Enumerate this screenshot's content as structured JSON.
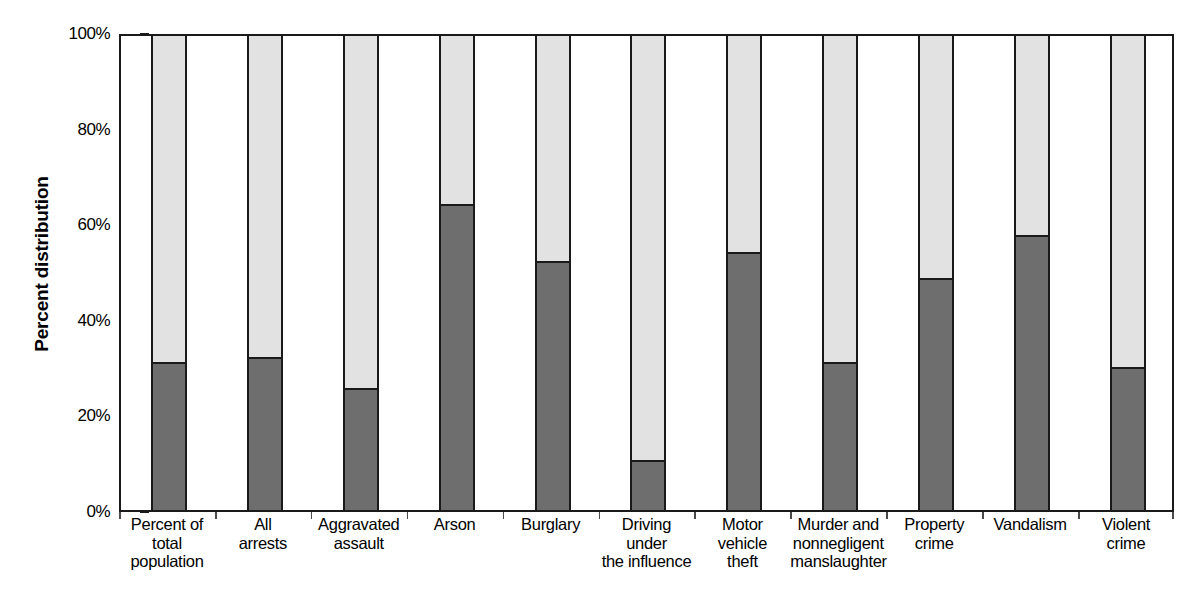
{
  "chart_data": {
    "type": "bar",
    "subtype": "stacked-100-percent",
    "title": "",
    "xlabel": "",
    "ylabel": "Percent distribution",
    "ylim": [
      0,
      100
    ],
    "ytick_labels": [
      "100%",
      "80%",
      "60%",
      "40%",
      "20%",
      "0%"
    ],
    "ytick_values": [
      100,
      80,
      60,
      40,
      20,
      0
    ],
    "grid": false,
    "legend": "none",
    "categories": [
      "Percent of\ntotal\npopulation",
      "All\narrests",
      "Aggravated\nassault",
      "Arson",
      "Burglary",
      "Driving\nunder\nthe influence",
      "Motor\nvehicle\ntheft",
      "Murder and\nnonnegligent\nmanslaughter",
      "Property\ncrime",
      "Vandalism",
      "Violent\ncrime"
    ],
    "series": [
      {
        "name": "lower-segment",
        "color": "#6e6e6e",
        "values": [
          31,
          32,
          25.5,
          64,
          52,
          10.5,
          54,
          31,
          48.5,
          57.5,
          30
        ]
      },
      {
        "name": "upper-segment",
        "color": "#e2e2e2",
        "values": [
          69,
          68,
          74.5,
          36,
          48,
          89.5,
          46,
          69,
          51.5,
          42.5,
          70
        ]
      }
    ]
  },
  "colors": {
    "axis": "#1a1a1a",
    "lower_segment": "#6e6e6e",
    "upper_segment": "#e2e2e2",
    "background": "#ffffff",
    "text": "#000000"
  }
}
